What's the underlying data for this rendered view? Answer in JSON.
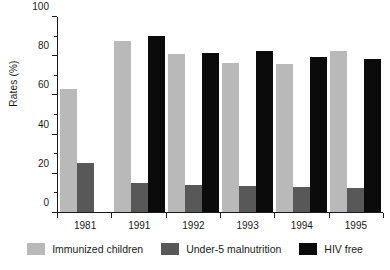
{
  "chart_data": {
    "type": "bar",
    "title": "",
    "xlabel": "",
    "ylabel": "Rates (%)",
    "ylim": [
      0,
      100
    ],
    "ytick_labels": [
      "0",
      "20",
      "40",
      "60",
      "80",
      "100"
    ],
    "ytick_values": [
      0,
      20,
      40,
      60,
      80,
      100
    ],
    "yminor_values": [
      10,
      30,
      50,
      70,
      90
    ],
    "grid": false,
    "legend_position": "bottom",
    "categories": [
      "1981",
      "1991",
      "1992",
      "1993",
      "1994",
      "1995"
    ],
    "series": [
      {
        "name": "Immunized children",
        "color": "#b9b9b9",
        "values": [
          63,
          87,
          80.5,
          76,
          75.5,
          82
        ]
      },
      {
        "name": "Under-5 malnutrition",
        "color": "#585858",
        "values": [
          25,
          15,
          14,
          13.5,
          13,
          12.5
        ]
      },
      {
        "name": "HIV free",
        "color": "#0b0b0b",
        "values": [
          null,
          90,
          81,
          82,
          79,
          78
        ]
      }
    ]
  }
}
